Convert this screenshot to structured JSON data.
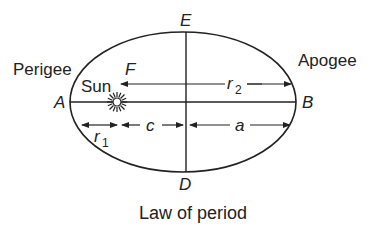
{
  "diagram": {
    "caption": "Law of period",
    "labels": {
      "perigee": "Perigee",
      "apogee": "Apogee",
      "sun": "Sun",
      "focus": "F",
      "point_a": "A",
      "point_b": "B",
      "point_e": "E",
      "point_d": "D",
      "r1": "r",
      "r1_sub": "1",
      "r2": "r",
      "r2_sub": "2",
      "c": "c",
      "a": "a"
    },
    "colors": {
      "stroke": "#222222",
      "background": "#ffffff"
    }
  }
}
